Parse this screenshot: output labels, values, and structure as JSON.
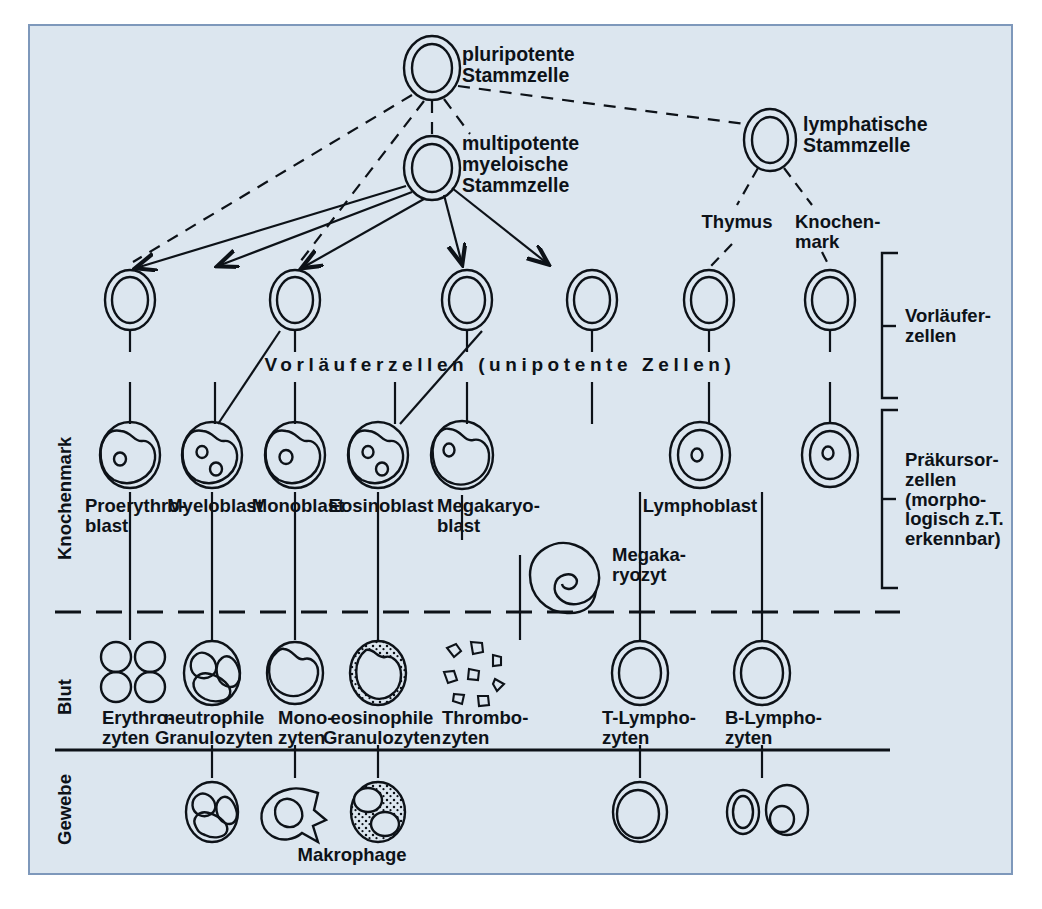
{
  "figure": {
    "language": "de",
    "background_color": "#dce6ef",
    "border_color": "#7e98bb",
    "ink_color": "#0d1218"
  },
  "compartments": [
    {
      "id": "knochenmark",
      "label": "Knochenmark"
    },
    {
      "id": "blut",
      "label": "Blut"
    },
    {
      "id": "gewebe",
      "label": "Gewebe"
    }
  ],
  "stem_cells": [
    {
      "id": "pluripotent",
      "label": "pluripotente\nStammzelle",
      "x": 432,
      "y": 68
    },
    {
      "id": "multipotent-myeloid",
      "label": "multipotente\nmyeloische\nStammzelle",
      "x": 432,
      "y": 168
    },
    {
      "id": "lymphatic",
      "label": "lymphatische\nStammzelle",
      "x": 770,
      "y": 140
    }
  ],
  "lymphatic_organs": [
    {
      "id": "thymus",
      "label": "Thymus",
      "x": 737,
      "y": 222
    },
    {
      "id": "knochenmark-organ",
      "label": "Knochen-\nmark",
      "x": 828,
      "y": 222
    }
  ],
  "band_label": "Vorläuferzellen (unipotente Zellen)",
  "brackets": [
    {
      "id": "vorlaeuferzellen",
      "label": "Vorläufer-\nzellen",
      "top": 253,
      "bottom": 398
    },
    {
      "id": "praekursorzellen",
      "label": "Präkursor-\nzellen\n(morpho-\nlogisch z.T.\nerkennbar)",
      "top": 410,
      "bottom": 588
    }
  ],
  "columns": [
    {
      "id": "erythroid",
      "x": 130,
      "progenitor": "",
      "precursor": "Proerythro-\nblast",
      "blood": "Erythro-\nzyten",
      "tissue": ""
    },
    {
      "id": "granulocyte-neutrophil",
      "x": 212,
      "progenitor": "",
      "precursor": "Myeloblast",
      "blood": "neutrophile\nGranulozyten",
      "tissue": ""
    },
    {
      "id": "monocyte",
      "x": 295,
      "progenitor": "",
      "precursor": "Monoblast",
      "blood": "Mono-\nzyten",
      "tissue": "Makrophage"
    },
    {
      "id": "granulocyte-eosinophil",
      "x": 378,
      "progenitor": "",
      "precursor": "Eosinoblast",
      "blood": "eosinophile\nGranulozyten",
      "tissue": ""
    },
    {
      "id": "megakaryocyte",
      "x": 462,
      "progenitor": "",
      "precursor": "Megakaryo-\nblast",
      "blood": "Thrombo-\nzyten",
      "tissue": "",
      "extra_cell": {
        "id": "megakaryozyt",
        "label": "Megaka-\nryozyt"
      }
    },
    {
      "id": "t-lymphocyte",
      "x": 640,
      "progenitor": "",
      "precursor": "",
      "blood": "T-Lympho-\nzyten",
      "tissue": ""
    },
    {
      "id": "b-lymphocyte",
      "x": 762,
      "progenitor": "",
      "precursor": "",
      "blood": "B-Lympho-\nzyten",
      "tissue": ""
    }
  ],
  "lymphoblast_label": "Lymphoblast",
  "rows": {
    "progenitor_y": 300,
    "band_y": 366,
    "precursor_y": 452,
    "blood_y": 668,
    "tissue_y": 805,
    "blood_divider_y": 612,
    "tissue_divider_y": 750
  }
}
